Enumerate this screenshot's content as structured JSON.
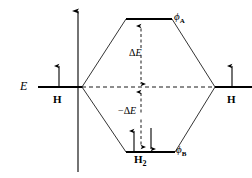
{
  "figure": {
    "width": 252,
    "height": 178,
    "background_color": "#ffffff",
    "line_color": "#000000"
  },
  "axis": {
    "label": "E",
    "name": "energy-axis",
    "direction": "up",
    "x": 78,
    "y_top": 8,
    "y_bottom": 172,
    "label_x": 22,
    "label_y": 84
  },
  "levels": {
    "left_atom": {
      "label": "H",
      "x_start": 38,
      "x_end": 82,
      "y": 87,
      "label_x": 53,
      "label_y": 95,
      "electrons": [
        {
          "spin": "up",
          "x": 59,
          "y_tail": 87,
          "y_head": 63
        }
      ]
    },
    "right_atom": {
      "label": "H",
      "x_start": 215,
      "x_end": 252,
      "y": 87,
      "label_x": 227,
      "label_y": 95,
      "electrons": [
        {
          "spin": "up",
          "x": 232,
          "y_tail": 87,
          "y_head": 63
        }
      ]
    },
    "antibonding": {
      "label": "ϕ",
      "subscript": "A",
      "x_start": 126,
      "x_end": 172,
      "y": 19,
      "label_x": 174,
      "label_y": 14,
      "electrons": []
    },
    "bonding": {
      "label": "ϕ",
      "subscript": "B",
      "molecule_label": "H",
      "molecule_subscript": "2",
      "x_start": 126,
      "x_end": 175,
      "y": 152,
      "label_x": 176,
      "label_y": 148,
      "molecule_label_x": 136,
      "molecule_label_y": 155,
      "electrons": [
        {
          "spin": "up",
          "x": 134,
          "y_tail": 152,
          "y_head": 128
        },
        {
          "spin": "down",
          "x": 151,
          "y_tail": 128,
          "y_head": 152
        }
      ]
    }
  },
  "centerline": {
    "name": "nonbonding-reference-line",
    "style": "dashed",
    "x_start": 82,
    "x_end": 215,
    "y": 87
  },
  "correlation_lines": [
    {
      "name": "left-to-antibonding",
      "x1": 82,
      "y1": 87,
      "x2": 126,
      "y2": 19
    },
    {
      "name": "right-to-antibonding",
      "x1": 215,
      "y1": 87,
      "x2": 172,
      "y2": 19
    },
    {
      "name": "left-to-bonding",
      "x1": 82,
      "y1": 87,
      "x2": 126,
      "y2": 152
    },
    {
      "name": "right-to-bonding",
      "x1": 215,
      "y1": 87,
      "x2": 175,
      "y2": 152
    }
  ],
  "energy_gaps": [
    {
      "name": "destabilization-gap",
      "label_delta": "Δ",
      "label_e": "E",
      "sign": "",
      "x": 141,
      "y_top": 21,
      "y_bottom": 87,
      "arrowheads": "both",
      "style": "dashed",
      "label_x": 130,
      "label_y": 48
    },
    {
      "name": "stabilization-gap",
      "label_delta": "Δ",
      "label_e": "E",
      "sign": "−",
      "x": 141,
      "y_top": 87,
      "y_bottom": 150,
      "arrowheads": "both",
      "style": "dashed",
      "label_x": 123,
      "label_y": 107
    }
  ],
  "chart_data": {
    "type": "diagram",
    "ylabel": "E",
    "levels": [
      {
        "name": "H atomic orbital (left)",
        "label": "H",
        "energy": 0,
        "occupancy": 1,
        "electrons": [
          "up"
        ]
      },
      {
        "name": "H atomic orbital (right)",
        "label": "H",
        "energy": 0,
        "occupancy": 1,
        "electrons": [
          "up"
        ]
      },
      {
        "name": "antibonding molecular orbital",
        "label": "ϕA",
        "energy": 1,
        "occupancy": 0,
        "electrons": []
      },
      {
        "name": "bonding molecular orbital",
        "label": "ϕB",
        "energy": -1,
        "occupancy": 2,
        "electrons": [
          "up",
          "down"
        ]
      }
    ],
    "annotations": [
      "ΔE",
      "−ΔE",
      "H",
      "H",
      "H2",
      "ϕA",
      "ϕB",
      "E"
    ]
  }
}
